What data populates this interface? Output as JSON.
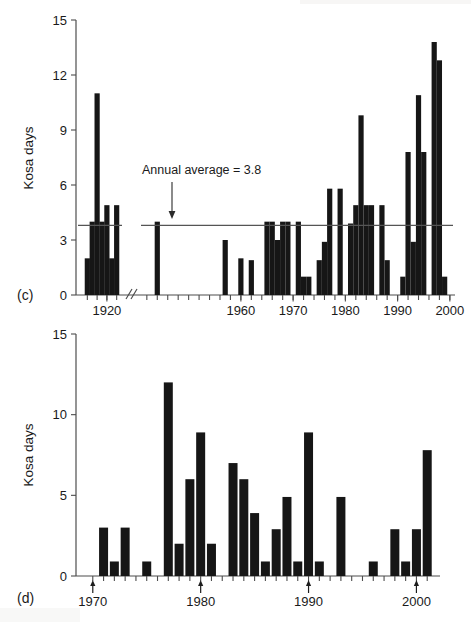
{
  "figure": {
    "panels": [
      {
        "label": "(c)",
        "ylabel": "Kosa days",
        "annotation": "Annual average = 3.8"
      },
      {
        "label": "(d)",
        "ylabel": "Kosa days"
      }
    ]
  },
  "chart_data": [
    {
      "type": "bar",
      "panel": "(c)",
      "title": "",
      "xlabel": "",
      "ylabel": "Kosa days",
      "ylim": [
        0,
        15
      ],
      "yticks": [
        0,
        3,
        6,
        9,
        12,
        15
      ],
      "ytick_labels": [
        "0",
        "3",
        "6",
        "9",
        "12",
        "15"
      ],
      "xticks": [
        1920,
        1960,
        1970,
        1980,
        1990,
        2000
      ],
      "xtick_labels": [
        "1920",
        "1960",
        "1970",
        "1980",
        "1990",
        "2000"
      ],
      "xlim": [
        1915,
        2000
      ],
      "axis_break": {
        "present": true,
        "symbol": "//",
        "between": [
          1923,
          1940
        ]
      },
      "grid": false,
      "legend": false,
      "annotations": [
        {
          "text": "Annual average = 3.8",
          "value": 3.8,
          "type": "hline-with-arrow"
        }
      ],
      "reference_line": {
        "label": "Annual average",
        "value": 3.8
      },
      "x": [
        1916,
        1917,
        1918,
        1919,
        1920,
        1921,
        1922,
        1944,
        1957,
        1960,
        1962,
        1965,
        1966,
        1967,
        1968,
        1969,
        1971,
        1972,
        1973,
        1975,
        1976,
        1977,
        1979,
        1981,
        1982,
        1983,
        1984,
        1985,
        1987,
        1988,
        1991,
        1992,
        1993,
        1994,
        1995,
        1997,
        1998,
        1999
      ],
      "values": [
        2.0,
        4.0,
        11.0,
        4.0,
        4.9,
        2.0,
        4.9,
        4.0,
        3.0,
        2.0,
        1.9,
        4.0,
        4.0,
        3.0,
        4.0,
        4.0,
        4.0,
        1.0,
        1.0,
        1.9,
        2.9,
        5.8,
        5.8,
        3.9,
        4.9,
        9.8,
        4.9,
        4.9,
        4.9,
        1.9,
        1.0,
        7.8,
        2.9,
        10.9,
        7.8,
        13.8,
        12.8,
        1.0
      ],
      "extra_values_note": ""
    },
    {
      "type": "bar",
      "panel": "(d)",
      "title": "",
      "xlabel": "",
      "ylabel": "Kosa days",
      "ylim": [
        0,
        15
      ],
      "yticks": [
        0,
        5,
        10,
        15
      ],
      "ytick_labels": [
        "0",
        "5",
        "10",
        "15"
      ],
      "xticks": [
        1970,
        1980,
        1990,
        2000
      ],
      "xtick_labels": [
        "1970",
        "1980",
        "1990",
        "2000"
      ],
      "xlim": [
        1969,
        2002
      ],
      "grid": false,
      "legend": false,
      "marked_ticks": [
        1970,
        1980,
        1990,
        2000
      ],
      "categories": [
        1970,
        1971,
        1972,
        1973,
        1974,
        1975,
        1976,
        1977,
        1978,
        1979,
        1980,
        1981,
        1982,
        1983,
        1984,
        1985,
        1986,
        1987,
        1988,
        1989,
        1990,
        1991,
        1992,
        1993,
        1994,
        1995,
        1996,
        1997,
        1998,
        1999,
        2000,
        2001
      ],
      "values": [
        0,
        3.0,
        0.9,
        3.0,
        0,
        0.9,
        0,
        12.0,
        2.0,
        6.0,
        8.9,
        2.0,
        0,
        7.0,
        6.0,
        3.9,
        0.9,
        2.9,
        4.9,
        0.9,
        8.9,
        0.9,
        0,
        4.9,
        0,
        0,
        0.9,
        0,
        2.9,
        0.9,
        2.9,
        7.8
      ]
    }
  ]
}
